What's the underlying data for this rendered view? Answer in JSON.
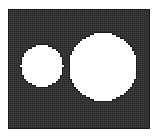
{
  "figure": {
    "title": "Quadrilateral finite element mesh of a rectangular plate with two circular holes",
    "caption": "",
    "type": "mesh-plot"
  },
  "canvas": {
    "width": 158,
    "height": 138,
    "background_color": "#ffffff"
  },
  "mesh": {
    "element_type": "quad",
    "cell_size": 2.0,
    "line_color": "#1a1a1a",
    "line_width": 0.9,
    "fill_color": "#ffffff",
    "hole_fill_color": "#ffffff",
    "plate": {
      "x": 8,
      "y": 9,
      "width": 142,
      "height": 119
    },
    "border": {
      "visible": true,
      "color": "#1a1a1a",
      "width": 1.0
    }
  },
  "holes": [
    {
      "name": "left-hole",
      "shape": "circle",
      "center_x": 42,
      "center_y": 66,
      "radius": 21
    },
    {
      "name": "right-hole",
      "shape": "circle",
      "center_x": 103,
      "center_y": 67,
      "radius": 34
    }
  ],
  "chart_data": {
    "type": "mesh",
    "title": "Quadrilateral finite element mesh of a rectangular plate with two circular holes",
    "xlabel": "",
    "ylabel": "",
    "xlim": [
      8,
      150
    ],
    "ylim": [
      9,
      128
    ],
    "grid": true,
    "legend": "none",
    "element_pitch": 2.0,
    "domain": {
      "outer_rectangle": [
        8,
        9,
        150,
        128
      ],
      "holes": [
        {
          "cx": 42,
          "cy": 66,
          "r": 21
        },
        {
          "cx": 103,
          "cy": 67,
          "r": 34
        }
      ]
    }
  }
}
